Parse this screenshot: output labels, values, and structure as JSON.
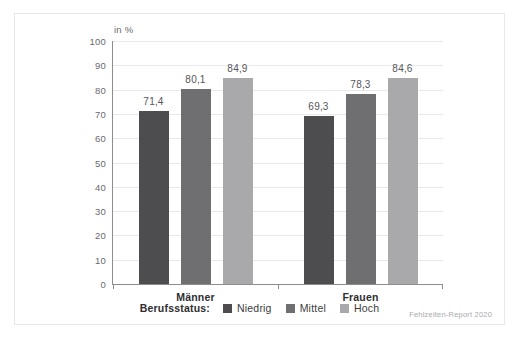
{
  "figure": {
    "unit_label": "in %",
    "source_note": "Fehlzeiten-Report 2020",
    "legend_title": "Berufsstatus:"
  },
  "colors": {
    "series_niedrig": "#4d4d4f",
    "series_mittel": "#6f6f72",
    "series_hoch": "#a9a9ac",
    "gridline": "#e9e9ec",
    "axis": "#8d8d90",
    "frame": "#e8e8ea",
    "tick_text": "#6a6a6e",
    "value_text": "#55555a",
    "label_text": "#2e2e30",
    "source_text": "#a9a9ad",
    "background": "#ffffff"
  },
  "chart_data": {
    "type": "bar",
    "title": "",
    "xlabel": "",
    "ylabel": "in %",
    "ylim": [
      0,
      100
    ],
    "yticks": [
      0,
      10,
      20,
      30,
      40,
      50,
      60,
      70,
      80,
      90,
      100
    ],
    "ytick_labels": [
      "0",
      "10",
      "20",
      "30",
      "40",
      "50",
      "60",
      "70",
      "80",
      "90",
      "100"
    ],
    "grid": true,
    "legend_position": "bottom-center",
    "categories": [
      "Männer",
      "Frauen"
    ],
    "series": [
      {
        "name": "Niedrig",
        "color": "#4d4d4f",
        "values": [
          71.4,
          69.3
        ],
        "labels": [
          "71,4",
          "69,3"
        ]
      },
      {
        "name": "Mittel",
        "color": "#6f6f72",
        "values": [
          80.1,
          78.3
        ],
        "labels": [
          "80,1",
          "78,3"
        ]
      },
      {
        "name": "Hoch",
        "color": "#a9a9ac",
        "values": [
          84.9,
          84.6
        ],
        "labels": [
          "84,9",
          "84,6"
        ]
      }
    ]
  }
}
